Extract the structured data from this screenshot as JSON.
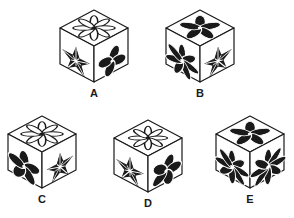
{
  "page": {
    "background_color": "#ffffff",
    "ink_color": "#1a1a1a",
    "type": "cube-folding-figure-choices",
    "rows": [
      [
        "A",
        "B"
      ],
      [
        "C",
        "D",
        "E"
      ]
    ]
  },
  "cubes": [
    {
      "id": "A",
      "label": "A",
      "faces": {
        "top": {
          "symbol": "flower-thin-many-petals",
          "fill": "outline-white",
          "petals": 8
        },
        "left": {
          "symbol": "star-faceted-5-point",
          "fill": "black-outline",
          "points": 5
        },
        "right": {
          "symbol": "flower-4-petals",
          "fill": "black",
          "petals": 4
        }
      }
    },
    {
      "id": "B",
      "label": "B",
      "faces": {
        "top": {
          "symbol": "flower-5-petals",
          "fill": "black",
          "petals": 5
        },
        "left": {
          "symbol": "flower-thin-many-petals",
          "fill": "black",
          "petals": 7
        },
        "right": {
          "symbol": "star-faceted-5-point",
          "fill": "black-outline",
          "points": 5
        }
      }
    },
    {
      "id": "C",
      "label": "C",
      "faces": {
        "top": {
          "symbol": "flower-thin-many-petals",
          "fill": "outline-white",
          "petals": 8
        },
        "left": {
          "symbol": "flower-5-petals",
          "fill": "black",
          "petals": 5
        },
        "right": {
          "symbol": "star-faceted-5-point",
          "fill": "black-outline",
          "points": 5
        }
      }
    },
    {
      "id": "D",
      "label": "D",
      "faces": {
        "top": {
          "symbol": "flower-thin-many-petals",
          "fill": "outline-white",
          "petals": 8
        },
        "left": {
          "symbol": "star-faceted-5-point",
          "fill": "black-outline",
          "points": 5
        },
        "right": {
          "symbol": "flower-5-petals",
          "fill": "black",
          "petals": 5
        }
      }
    },
    {
      "id": "E",
      "label": "E",
      "faces": {
        "top": {
          "symbol": "flower-5-petals",
          "fill": "black",
          "petals": 5
        },
        "left": {
          "symbol": "flower-thin-many-petals",
          "fill": "black",
          "petals": 8
        },
        "right": {
          "symbol": "flower-thin-many-petals",
          "fill": "black",
          "petals": 8
        }
      }
    }
  ]
}
